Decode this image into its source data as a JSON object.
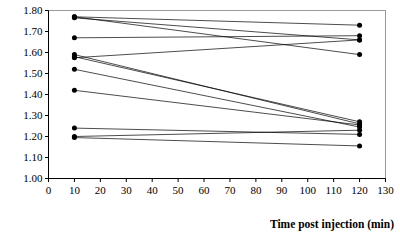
{
  "chart_data": {
    "type": "line",
    "title": "",
    "xlabel": "Time post injection (min)",
    "ylabel": "",
    "xlim": [
      0,
      130
    ],
    "ylim": [
      1.0,
      1.8
    ],
    "grid": false,
    "legend": "none",
    "x": [
      10,
      120
    ],
    "xticks": [
      0,
      10,
      20,
      30,
      40,
      50,
      60,
      70,
      80,
      90,
      100,
      110,
      120,
      130
    ],
    "xtick_labels": [
      "0",
      "10",
      "20",
      "30",
      "40",
      "50",
      "60",
      "70",
      "80",
      "90",
      "100",
      "110",
      "120",
      "130"
    ],
    "yticks": [
      1.0,
      1.1,
      1.2,
      1.3,
      1.4,
      1.5,
      1.6,
      1.7,
      1.8
    ],
    "ytick_labels": [
      "1.00",
      "1.10",
      "1.20",
      "1.30",
      "1.40",
      "1.50",
      "1.60",
      "1.70",
      "1.80"
    ],
    "marker": "filled-circle",
    "series": [
      {
        "name": "subject-1",
        "values": [
          1.77,
          1.73
        ]
      },
      {
        "name": "subject-2",
        "values": [
          1.765,
          1.66
        ]
      },
      {
        "name": "subject-3",
        "values": [
          1.77,
          1.59
        ]
      },
      {
        "name": "subject-4",
        "values": [
          1.67,
          1.68
        ]
      },
      {
        "name": "subject-5",
        "values": [
          1.59,
          1.26
        ]
      },
      {
        "name": "subject-6",
        "values": [
          1.58,
          1.27
        ]
      },
      {
        "name": "subject-7",
        "values": [
          1.575,
          1.66
        ]
      },
      {
        "name": "subject-8",
        "values": [
          1.52,
          1.245
        ]
      },
      {
        "name": "subject-9",
        "values": [
          1.42,
          1.255
        ]
      },
      {
        "name": "subject-10",
        "values": [
          1.24,
          1.21
        ]
      },
      {
        "name": "subject-11",
        "values": [
          1.2,
          1.23
        ]
      },
      {
        "name": "subject-12",
        "values": [
          1.195,
          1.155
        ]
      }
    ]
  }
}
